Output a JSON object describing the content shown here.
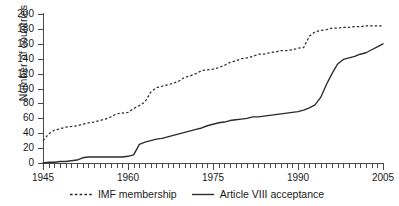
{
  "chart_data": {
    "type": "line",
    "title": "",
    "subtitle": "",
    "xlabel": "",
    "ylabel": "Number of countries",
    "xlim": [
      1945,
      2005
    ],
    "ylim": [
      0,
      200
    ],
    "grid": false,
    "legend_position": "bottom-center",
    "y_ticks": [
      0,
      20,
      40,
      60,
      80,
      100,
      120,
      140,
      160,
      180,
      200
    ],
    "y_tick_labels": [
      "0",
      "20",
      "40",
      "60",
      "80",
      "100",
      "120",
      "140",
      "160",
      "180",
      "200"
    ],
    "x_ticks": [
      1945,
      1960,
      1975,
      1990,
      2005
    ],
    "x_tick_labels": [
      "1945",
      "1960",
      "1975",
      "1990",
      "2005"
    ],
    "x_minor_tick_interval": 1,
    "x": [
      1945,
      1946,
      1947,
      1948,
      1949,
      1950,
      1951,
      1952,
      1953,
      1954,
      1955,
      1956,
      1957,
      1958,
      1959,
      1960,
      1961,
      1962,
      1963,
      1964,
      1965,
      1966,
      1967,
      1968,
      1969,
      1970,
      1971,
      1972,
      1973,
      1974,
      1975,
      1976,
      1977,
      1978,
      1979,
      1980,
      1981,
      1982,
      1983,
      1984,
      1985,
      1986,
      1987,
      1988,
      1989,
      1990,
      1991,
      1992,
      1993,
      1994,
      1995,
      1996,
      1997,
      1998,
      1999,
      2000,
      2001,
      2002,
      2003,
      2004,
      2005
    ],
    "series": [
      {
        "name": "IMF membership",
        "style": "dashed",
        "color": "#2b2b2b",
        "values": [
          30,
          39,
          44,
          46,
          48,
          49,
          50,
          52,
          54,
          55,
          57,
          59,
          62,
          66,
          67,
          68,
          73,
          77,
          82,
          95,
          101,
          103,
          105,
          107,
          110,
          115,
          117,
          120,
          124,
          125,
          126,
          128,
          131,
          135,
          137,
          140,
          141,
          143,
          146,
          146,
          148,
          149,
          151,
          151,
          152,
          154,
          155,
          170,
          176,
          178,
          179,
          181,
          181,
          182,
          182,
          183,
          183,
          184,
          184,
          184,
          184
        ]
      },
      {
        "name": "Article VIII acceptance",
        "style": "solid",
        "color": "#2b2b2b",
        "values": [
          0,
          1,
          1,
          2,
          2,
          3,
          4,
          7,
          8,
          8,
          8,
          8,
          8,
          8,
          8,
          9,
          11,
          25,
          28,
          30,
          32,
          33,
          35,
          37,
          39,
          41,
          43,
          45,
          47,
          50,
          52,
          54,
          55,
          57,
          58,
          59,
          60,
          62,
          62,
          63,
          64,
          65,
          66,
          67,
          68,
          69,
          71,
          74,
          78,
          88,
          105,
          120,
          133,
          139,
          141,
          143,
          146,
          148,
          152,
          156,
          160
        ]
      }
    ]
  },
  "legend": {
    "items": [
      {
        "label": "IMF membership",
        "style": "dashed"
      },
      {
        "label": "Article VIII acceptance",
        "style": "solid"
      }
    ]
  }
}
